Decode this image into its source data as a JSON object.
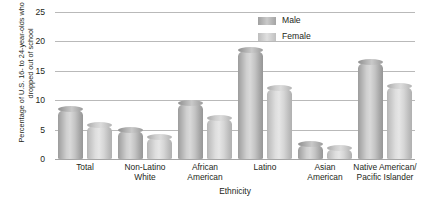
{
  "chart_data": {
    "type": "bar",
    "title": "",
    "xlabel": "Ethnicity",
    "ylabel": "Percentage of U.S. 16- to 24-year-olds who have dropped out of school",
    "categories": [
      "Total",
      "Non-Latino White",
      "African American",
      "Latino",
      "Asian American",
      "Native American/ Pacific Islander"
    ],
    "category_lines": [
      [
        "Total"
      ],
      [
        "Non-Latino",
        "White"
      ],
      [
        "African",
        "American"
      ],
      [
        "Latino"
      ],
      [
        "Asian",
        "American"
      ],
      [
        "Native American/",
        "Pacific Islander"
      ]
    ],
    "series": [
      {
        "name": "Male",
        "values": [
          8.5,
          5.0,
          9.5,
          18.5,
          2.5,
          16.5
        ],
        "color": "#c0c0c0"
      },
      {
        "name": "Female",
        "values": [
          5.7,
          3.8,
          7.0,
          12.0,
          1.8,
          12.5
        ],
        "color": "#d8d8d8"
      }
    ],
    "ylim": [
      0,
      25
    ],
    "yticks": [
      25,
      20,
      15,
      10,
      5,
      0
    ],
    "grid": true,
    "legend_position": "top-right"
  },
  "legend": {
    "items": [
      {
        "label": "Male"
      },
      {
        "label": "Female"
      }
    ]
  }
}
